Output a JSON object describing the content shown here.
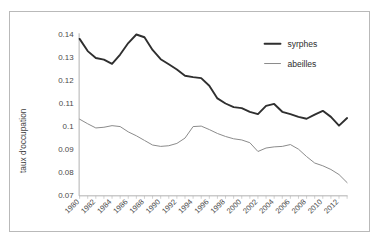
{
  "chart_data": {
    "type": "line",
    "title": "",
    "xlabel": "",
    "ylabel": "taux d'occupation",
    "ylim": [
      0.07,
      0.14
    ],
    "xlim": [
      1980,
      2013
    ],
    "ytick_labels": [
      "0.14",
      "0.13",
      "0.12",
      "0.11",
      "0.1",
      "0.09",
      "0.08",
      "0.07"
    ],
    "ytick_values": [
      0.14,
      0.13,
      0.12,
      0.11,
      0.1,
      0.09,
      0.08,
      0.07
    ],
    "xtick_labels": [
      "1980",
      "1982",
      "1984",
      "1986",
      "1988",
      "1990",
      "1992",
      "1994",
      "1996",
      "1998",
      "2000",
      "2002",
      "2004",
      "2006",
      "2008",
      "2010",
      "2012"
    ],
    "xtick_values": [
      1980,
      1982,
      1984,
      1986,
      1988,
      1990,
      1992,
      1994,
      1996,
      1998,
      2000,
      2002,
      2004,
      2006,
      2008,
      2010,
      2012
    ],
    "grid": false,
    "legend_position": "top-right",
    "x": [
      1980,
      1981,
      1982,
      1983,
      1984,
      1985,
      1986,
      1987,
      1988,
      1989,
      1990,
      1991,
      1992,
      1993,
      1994,
      1995,
      1996,
      1997,
      1998,
      1999,
      2000,
      2001,
      2002,
      2003,
      2004,
      2005,
      2006,
      2007,
      2008,
      2009,
      2010,
      2011,
      2012,
      2013
    ],
    "series": [
      {
        "name": "syrphes",
        "color": "#2f2f2f",
        "width": 1.9,
        "values": [
          0.1378,
          0.1325,
          0.1295,
          0.1288,
          0.127,
          0.131,
          0.136,
          0.1397,
          0.1385,
          0.133,
          0.129,
          0.1268,
          0.1245,
          0.1218,
          0.1212,
          0.1208,
          0.1175,
          0.112,
          0.1098,
          0.1082,
          0.1078,
          0.1062,
          0.1052,
          0.1088,
          0.1096,
          0.1062,
          0.1052,
          0.104,
          0.1032,
          0.105,
          0.1066,
          0.104,
          0.1002,
          0.1035
        ]
      },
      {
        "name": "abeilles",
        "color": "#8a8a8a",
        "width": 1.0,
        "values": [
          0.103,
          0.101,
          0.0992,
          0.0995,
          0.1002,
          0.0998,
          0.0975,
          0.0958,
          0.0938,
          0.0918,
          0.0912,
          0.0915,
          0.0925,
          0.0948,
          0.0998,
          0.1,
          0.0985,
          0.0968,
          0.0955,
          0.0945,
          0.094,
          0.0928,
          0.089,
          0.0905,
          0.091,
          0.0912,
          0.092,
          0.09,
          0.0868,
          0.084,
          0.0828,
          0.0812,
          0.079,
          0.0755
        ]
      }
    ],
    "legend": [
      {
        "label": "syrphes"
      },
      {
        "label": "abeilles"
      }
    ]
  }
}
